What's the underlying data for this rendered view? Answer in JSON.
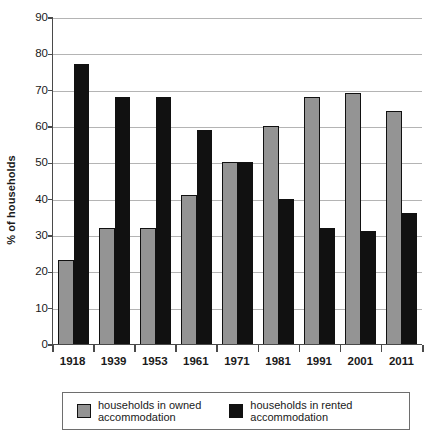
{
  "chart_data": {
    "type": "bar",
    "title": "",
    "subtitle": "",
    "xlabel": "",
    "ylabel": "% of households",
    "ylim": [
      0,
      90
    ],
    "ytick_step": 10,
    "yticks": [
      90,
      80,
      70,
      60,
      50,
      40,
      30,
      20,
      10,
      0
    ],
    "grid": true,
    "grid_axis": "y",
    "legend_position": "bottom",
    "categories": [
      "1918",
      "1939",
      "1953",
      "1961",
      "1971",
      "1981",
      "1991",
      "2001",
      "2011"
    ],
    "series": [
      {
        "name": "households in owned\naccommodation",
        "color": "#949494",
        "values": [
          23,
          32,
          32,
          41,
          50,
          60,
          68,
          69,
          64
        ]
      },
      {
        "name": "households in rented\naccommodation",
        "color": "#111111",
        "values": [
          77,
          68,
          68,
          59,
          50,
          40,
          32,
          31,
          36
        ]
      }
    ]
  },
  "axes": {
    "y_title": "% of households"
  },
  "legend": {
    "entries": [
      {
        "label": "households in owned\naccommodation",
        "swatch": "owned"
      },
      {
        "label": "households in rented\naccommodation",
        "swatch": "rented"
      }
    ]
  }
}
